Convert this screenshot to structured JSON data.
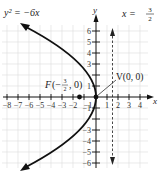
{
  "equation_label": "y² = −6x",
  "directrix_label": "x = 3/2",
  "directrix": {
    "lhs": "x =",
    "num": "3",
    "den": "2"
  },
  "focus_label": {
    "prefix": "F(−",
    "num": "3",
    "den": "2",
    "suffix": ", 0)"
  },
  "vertex_label": "V(0, 0)",
  "axes": {
    "x_label": "x",
    "y_label": "y"
  },
  "x_ticks": [
    "−8",
    "−7",
    "−6",
    "−5",
    "−4",
    "−3",
    "−2",
    "−1",
    "1",
    "2",
    "3",
    "4"
  ],
  "y_ticks": [
    "6",
    "5",
    "4",
    "3",
    "1",
    "−1",
    "−3",
    "−4",
    "−5",
    "−6"
  ],
  "colors": {
    "curve": "#111111",
    "grid": "#d8d8d8",
    "axis": "#111111"
  }
}
